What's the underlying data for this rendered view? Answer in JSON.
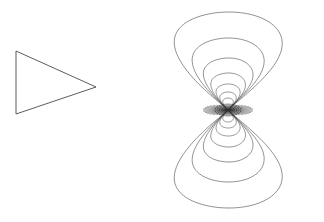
{
  "figure": {
    "title": "",
    "background_color": "#ffffff",
    "width": 324,
    "height": 222
  },
  "panels": [
    {
      "name": "triangle-panel",
      "label": "",
      "shape": "triangle",
      "stroke_color": "#4a4a4a"
    },
    {
      "name": "contour-panel",
      "label": "",
      "stroke_color": "#555555"
    }
  ],
  "chart_data": {
    "type": "line",
    "title": "",
    "subtitle": "",
    "xlabel": "",
    "ylabel": "",
    "grid": false,
    "legend_position": "none",
    "axes_visible": false,
    "tick_labels_x": [],
    "tick_labels_y": [],
    "xlim": [
      168,
      316
    ],
    "ylim": [
      8,
      212
    ],
    "singularity": {
      "x": 228,
      "y": 110,
      "radiating_line_count": 48
    },
    "series": [
      {
        "name": "triangle-outline",
        "type": "polygon",
        "closed": true,
        "stroke": "#4a4a4a",
        "points": [
          [
            16,
            51
          ],
          [
            96,
            87
          ],
          [
            16,
            114
          ]
        ]
      },
      {
        "name": "upper-lobe-contour-1",
        "type": "lobe",
        "orientation": "up",
        "level": 1,
        "half_width": 72,
        "height": 98,
        "stroke": "#555555"
      },
      {
        "name": "upper-lobe-contour-2",
        "type": "lobe",
        "orientation": "up",
        "level": 2,
        "half_width": 48,
        "height": 72,
        "stroke": "#555555"
      },
      {
        "name": "upper-lobe-contour-3",
        "type": "lobe",
        "orientation": "up",
        "level": 3,
        "half_width": 33,
        "height": 52,
        "stroke": "#555555"
      },
      {
        "name": "upper-lobe-contour-4",
        "type": "lobe",
        "orientation": "up",
        "level": 4,
        "half_width": 23,
        "height": 37,
        "stroke": "#3d3d3d"
      },
      {
        "name": "upper-lobe-contour-5",
        "type": "lobe",
        "orientation": "up",
        "level": 5,
        "half_width": 16,
        "height": 26,
        "stroke": "#3d3d3d"
      },
      {
        "name": "upper-lobe-contour-6",
        "type": "lobe",
        "orientation": "up",
        "level": 6,
        "half_width": 11,
        "height": 18,
        "stroke": "#2b2b2b"
      },
      {
        "name": "upper-lobe-contour-7",
        "type": "lobe",
        "orientation": "up",
        "level": 7,
        "half_width": 7,
        "height": 12,
        "stroke": "#2b2b2b"
      },
      {
        "name": "lower-lobe-contour-1",
        "type": "lobe",
        "orientation": "down",
        "level": 1,
        "half_width": 72,
        "height": 98,
        "stroke": "#555555"
      },
      {
        "name": "lower-lobe-contour-2",
        "type": "lobe",
        "orientation": "down",
        "level": 2,
        "half_width": 48,
        "height": 72,
        "stroke": "#555555"
      },
      {
        "name": "lower-lobe-contour-3",
        "type": "lobe",
        "orientation": "down",
        "level": 3,
        "half_width": 33,
        "height": 52,
        "stroke": "#555555"
      },
      {
        "name": "lower-lobe-contour-4",
        "type": "lobe",
        "orientation": "down",
        "level": 4,
        "half_width": 23,
        "height": 37,
        "stroke": "#3d3d3d"
      },
      {
        "name": "lower-lobe-contour-5",
        "type": "lobe",
        "orientation": "down",
        "level": 5,
        "half_width": 16,
        "height": 26,
        "stroke": "#3d3d3d"
      },
      {
        "name": "lower-lobe-contour-6",
        "type": "lobe",
        "orientation": "down",
        "level": 6,
        "half_width": 11,
        "height": 18,
        "stroke": "#2b2b2b"
      },
      {
        "name": "lower-lobe-contour-7",
        "type": "lobe",
        "orientation": "down",
        "level": 7,
        "half_width": 7,
        "height": 12,
        "stroke": "#2b2b2b"
      }
    ]
  }
}
